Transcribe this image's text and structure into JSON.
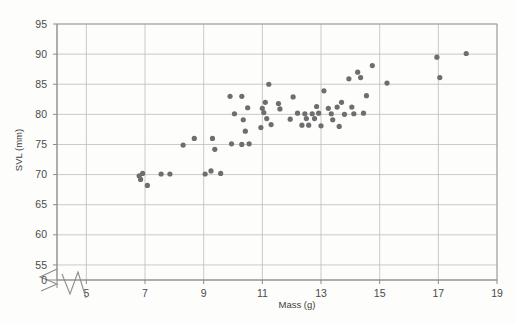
{
  "chart_data": {
    "type": "scatter",
    "title": "",
    "xlabel": "Mass (g)",
    "ylabel": "SVL (mm)",
    "xlim": [
      4.0,
      19.0
    ],
    "ylim": [
      52.5,
      95.0
    ],
    "xticks": [
      5,
      7,
      9,
      11,
      13,
      15,
      17,
      19
    ],
    "yticks": [
      55,
      60,
      65,
      70,
      75,
      80,
      85,
      90,
      95
    ],
    "origin_label": "0",
    "axis_break": true,
    "axis_break_axes": [
      "x",
      "y"
    ],
    "grid": true,
    "grid_color": "#bdbdbd",
    "legend": null,
    "marker_color": "#6e6e6e",
    "marker_size": 5.2,
    "background_color": "#fdfdfc",
    "points": [
      [
        6.8,
        69.8
      ],
      [
        6.85,
        69.2
      ],
      [
        6.92,
        70.2
      ],
      [
        7.08,
        68.2
      ],
      [
        7.55,
        70.1
      ],
      [
        7.85,
        70.1
      ],
      [
        8.3,
        74.9
      ],
      [
        8.68,
        76.0
      ],
      [
        9.05,
        70.1
      ],
      [
        9.25,
        70.6
      ],
      [
        9.3,
        76.0
      ],
      [
        9.38,
        74.2
      ],
      [
        9.58,
        70.2
      ],
      [
        9.9,
        83.0
      ],
      [
        10.3,
        83.0
      ],
      [
        10.05,
        80.1
      ],
      [
        9.95,
        75.1
      ],
      [
        10.3,
        75.0
      ],
      [
        10.35,
        79.1
      ],
      [
        10.42,
        77.2
      ],
      [
        10.5,
        81.1
      ],
      [
        10.55,
        75.1
      ],
      [
        10.95,
        77.8
      ],
      [
        11.0,
        81.0
      ],
      [
        11.05,
        80.3
      ],
      [
        11.1,
        82.0
      ],
      [
        11.15,
        79.3
      ],
      [
        11.22,
        85.0
      ],
      [
        11.3,
        78.3
      ],
      [
        11.55,
        81.8
      ],
      [
        11.6,
        80.9
      ],
      [
        11.95,
        79.2
      ],
      [
        12.05,
        82.9
      ],
      [
        12.2,
        80.2
      ],
      [
        12.35,
        78.2
      ],
      [
        12.45,
        80.1
      ],
      [
        12.5,
        79.3
      ],
      [
        12.58,
        78.2
      ],
      [
        12.7,
        80.1
      ],
      [
        12.78,
        79.3
      ],
      [
        12.85,
        81.3
      ],
      [
        12.92,
        80.2
      ],
      [
        13.0,
        78.1
      ],
      [
        13.1,
        83.9
      ],
      [
        13.25,
        81.0
      ],
      [
        13.35,
        80.1
      ],
      [
        13.4,
        79.1
      ],
      [
        13.55,
        81.2
      ],
      [
        13.62,
        78.0
      ],
      [
        13.7,
        82.0
      ],
      [
        13.8,
        80.0
      ],
      [
        13.95,
        85.9
      ],
      [
        14.05,
        81.2
      ],
      [
        14.12,
        80.1
      ],
      [
        14.25,
        87.0
      ],
      [
        14.35,
        86.1
      ],
      [
        14.45,
        80.2
      ],
      [
        14.55,
        83.1
      ],
      [
        14.75,
        88.1
      ],
      [
        15.25,
        85.2
      ],
      [
        16.95,
        89.5
      ],
      [
        17.05,
        86.1
      ],
      [
        17.95,
        90.1
      ]
    ]
  }
}
